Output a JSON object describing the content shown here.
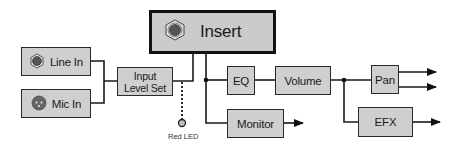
{
  "diagram": {
    "colors": {
      "block_fill": "#cfcfcf",
      "block_border": "#2a2a2a",
      "wire": "#1a1a1a",
      "led_fill": "#bdbdbd"
    },
    "blocks": {
      "line_in": {
        "label": "Line In",
        "icon": "quarter-inch-jack-icon"
      },
      "mic_in": {
        "label": "Mic In",
        "icon": "xlr-connector-icon"
      },
      "input_level_set": {
        "label": "Input\nLevel Set"
      },
      "insert": {
        "label": "Insert",
        "icon": "insert-jack-icon"
      },
      "eq": {
        "label": "EQ"
      },
      "volume": {
        "label": "Volume"
      },
      "pan": {
        "label": "Pan"
      },
      "monitor": {
        "label": "Monitor"
      },
      "efx": {
        "label": "EFX"
      }
    },
    "indicator": {
      "label": "Red LED"
    },
    "connections": [
      [
        "Line In",
        "Input Level Set"
      ],
      [
        "Mic In",
        "Input Level Set"
      ],
      [
        "Input Level Set",
        "Insert"
      ],
      [
        "Input Level Set",
        "Red LED"
      ],
      [
        "Insert",
        "EQ"
      ],
      [
        "Insert",
        "Monitor"
      ],
      [
        "EQ",
        "Volume"
      ],
      [
        "Volume",
        "Pan"
      ],
      [
        "Volume",
        "EFX"
      ],
      [
        "Pan",
        "output-L"
      ],
      [
        "Pan",
        "output-R"
      ],
      [
        "Monitor",
        "output"
      ],
      [
        "EFX",
        "output"
      ]
    ]
  }
}
